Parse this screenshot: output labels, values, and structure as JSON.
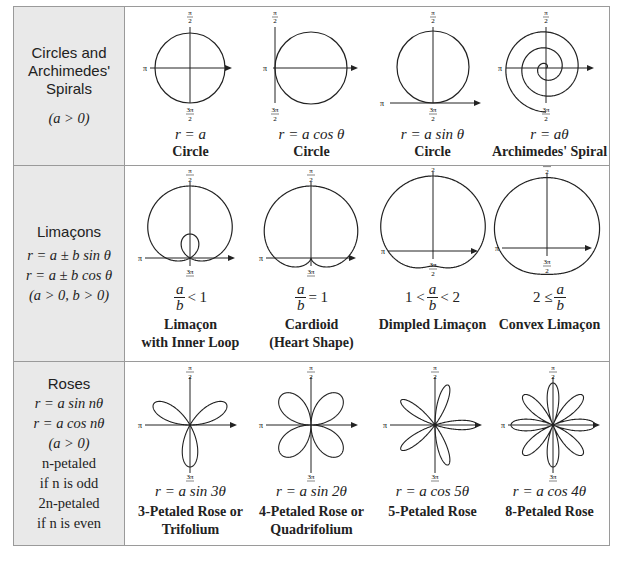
{
  "table": {
    "rows": [
      {
        "category": {
          "title_lines": [
            "Circles and",
            "Archimedes'",
            "Spirals"
          ],
          "conditions": [
            "(a > 0)"
          ]
        },
        "examples": [
          {
            "equation": "r = a",
            "name_lines": [
              "Circle"
            ],
            "graph": "circle-centered-icon"
          },
          {
            "equation": "r = a cos θ",
            "name_lines": [
              "Circle"
            ],
            "graph": "circle-cos-icon"
          },
          {
            "equation": "r = a sin θ",
            "name_lines": [
              "Circle"
            ],
            "graph": "circle-sin-icon"
          },
          {
            "equation": "r = aθ",
            "name_lines": [
              "Archimedes' Spiral"
            ],
            "graph": "archimedes-spiral-icon"
          }
        ]
      },
      {
        "category": {
          "title_lines": [
            "Limaçons"
          ],
          "conditions": [
            "r = a ± b sin θ",
            "r = a ± b cos θ",
            "(a > 0, b > 0)"
          ]
        },
        "examples": [
          {
            "ratio_left": "",
            "ratio_right": "< 1",
            "name_lines": [
              "Limaçon",
              "with Inner Loop"
            ],
            "graph": "limacon-inner-loop-icon"
          },
          {
            "ratio_left": "",
            "ratio_right": "= 1",
            "name_lines": [
              "Cardioid",
              "(Heart Shape)"
            ],
            "graph": "cardioid-icon"
          },
          {
            "ratio_left": "1 <",
            "ratio_right": "< 2",
            "name_lines": [
              "Dimpled Limaçon"
            ],
            "graph": "dimpled-limacon-icon"
          },
          {
            "ratio_left": "2 ≤",
            "ratio_right": "",
            "name_lines": [
              "Convex Limaçon"
            ],
            "graph": "convex-limacon-icon"
          }
        ],
        "ratio": {
          "num": "a",
          "den": "b"
        }
      },
      {
        "category": {
          "title_lines": [
            "Roses"
          ],
          "conditions": [
            "r = a sin nθ",
            "r = a cos nθ",
            "(a > 0)",
            "n-petaled",
            "if n is odd",
            "2n-petaled",
            "if n is even"
          ]
        },
        "examples": [
          {
            "equation": "r = a sin 3θ",
            "name_lines": [
              "3-Petaled Rose or",
              "Trifolium"
            ],
            "graph": "rose-3-petal-icon"
          },
          {
            "equation": "r = a sin 2θ",
            "name_lines": [
              "4-Petaled Rose or",
              "Quadrifolium"
            ],
            "graph": "rose-4-petal-icon"
          },
          {
            "equation": "r = a cos 5θ",
            "name_lines": [
              "5-Petaled Rose"
            ],
            "graph": "rose-5-petal-icon"
          },
          {
            "equation": "r = a cos 4θ",
            "name_lines": [
              "8-Petaled Rose"
            ],
            "graph": "rose-8-petal-icon"
          }
        ]
      }
    ],
    "axis_labels": {
      "top": "π/2",
      "left": "π",
      "bottom": "3π/2",
      "pi": "π",
      "pi_half_num": "π",
      "pi_half_den": "2",
      "three_pi_num": "3π",
      "three_pi_den": "2"
    }
  }
}
